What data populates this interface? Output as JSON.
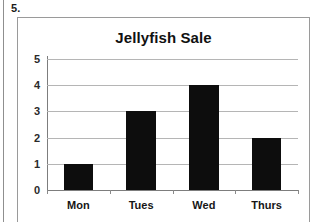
{
  "worksheet": {
    "question_number": "5."
  },
  "chart_data": {
    "type": "bar",
    "title": "Jellyfish Sale",
    "categories": [
      "Mon",
      "Tues",
      "Wed",
      "Thurs"
    ],
    "values": [
      1,
      3,
      4,
      2
    ],
    "xlabel": "",
    "ylabel": "",
    "ylim": [
      0,
      5
    ],
    "ytick_labels": [
      "0",
      "1",
      "2",
      "3",
      "4",
      "5"
    ],
    "ytick_values": [
      0,
      1,
      2,
      3,
      4,
      5
    ],
    "grid": true,
    "legend": "none",
    "bar_color": "#0d0d0d",
    "grid_color": "#b5b5b5",
    "axis_color": "#7d7d7d"
  }
}
